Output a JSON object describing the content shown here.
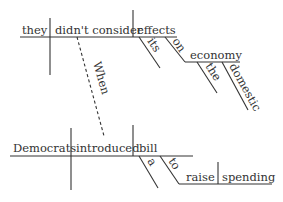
{
  "diagram": {
    "type": "sentence-diagram",
    "main_clause": {
      "subject": "they",
      "verb": "didn't consider",
      "object": "effects",
      "object_modifiers": [
        "its",
        "on"
      ],
      "prep_object": "economy",
      "prep_object_modifiers": [
        "the",
        "domestic"
      ]
    },
    "connector": "When",
    "sub_clause": {
      "subject": "Democrats",
      "verb": "introduced",
      "object": "bill",
      "object_modifiers": [
        "a",
        "to"
      ],
      "infinitive_verb": "raise",
      "infinitive_object": "spending"
    },
    "colors": {
      "ink": "#333333",
      "background": "#ffffff"
    }
  }
}
